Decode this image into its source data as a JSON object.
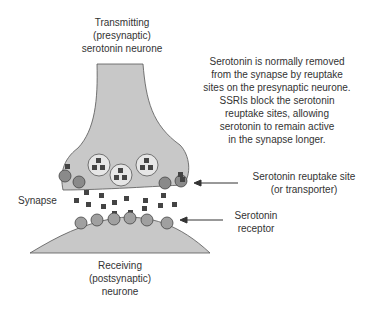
{
  "diagram": {
    "labels": {
      "transmitting": [
        "Transmitting",
        "(presynaptic)",
        "serotonin neurone"
      ],
      "explanation": [
        "Serotonin is normally removed",
        "from the synapse by reuptake",
        "sites on the presynaptic neurone.",
        "SSRIs block the serotonin",
        "reuptake sites, allowing",
        "serotonin to remain active",
        "in the synapse longer."
      ],
      "reuptake_site": [
        "Serotonin reuptake site",
        "(or transporter)"
      ],
      "synapse": "Synapse",
      "receptor": [
        "Serotonin",
        "receptor"
      ],
      "receiving": [
        "Receiving",
        "(postsynaptic)",
        "neurone"
      ]
    },
    "colors": {
      "neuron_fill": "#c8c8c8",
      "outline": "#555555",
      "molecule": "#444444",
      "site_fill": "#8a8a8a",
      "receptor_fill": "#a0a0a0"
    }
  }
}
